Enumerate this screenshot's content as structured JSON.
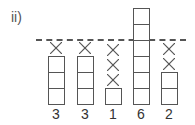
{
  "label": "ii)",
  "columns": [
    {
      "value": "3",
      "boxes": 3,
      "crosses": 1
    },
    {
      "value": "3",
      "boxes": 3,
      "crosses": 1
    },
    {
      "value": "1",
      "boxes": 1,
      "crosses": 3
    },
    {
      "value": "6",
      "boxes": 6,
      "crosses": 0
    },
    {
      "value": "2",
      "boxes": 2,
      "crosses": 2
    }
  ],
  "line_color": "#555555"
}
